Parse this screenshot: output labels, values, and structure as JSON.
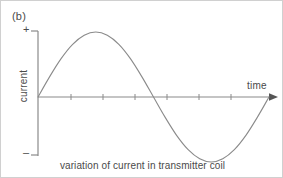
{
  "figure": {
    "panel_label": "(b)",
    "caption": "variation of current in transmitter coil",
    "background_color": "#ffffff",
    "line_color": "#808080",
    "text_color": "#4a4a4a"
  },
  "axes": {
    "y_title": "current",
    "y_positive_marker": "+",
    "y_negative_marker": "–",
    "x_title": "time",
    "x_arrow": "arrow-right"
  },
  "chart_data": {
    "type": "line",
    "title": "variation of current in transmitter coil",
    "xlabel": "time",
    "ylabel": "current",
    "grid": false,
    "legend": null,
    "xlim": [
      0,
      1.0
    ],
    "ylim": [
      -1.12,
      1.12
    ],
    "x_tick_labels": [],
    "y_tick_labels": [
      "+",
      "–"
    ],
    "x_tick_count": 6,
    "annotations": [
      "(b)"
    ],
    "series": [
      {
        "name": "transmitter coil current",
        "description": "one full sine cycle starting at zero, rising to a positive peak, falling through zero to a negative trough, then rising back through zero",
        "x": [
          0.0,
          0.05,
          0.1,
          0.15,
          0.2,
          0.25,
          0.3,
          0.35,
          0.4,
          0.45,
          0.5,
          0.55,
          0.6,
          0.65,
          0.7,
          0.75,
          0.8,
          0.85,
          0.9,
          0.95,
          1.0
        ],
        "y": [
          0.0,
          0.31,
          0.59,
          0.81,
          0.95,
          1.0,
          0.95,
          0.81,
          0.59,
          0.31,
          0.0,
          -0.31,
          -0.59,
          -0.81,
          -0.95,
          -1.0,
          -0.95,
          -0.81,
          -0.59,
          -0.31,
          0.0
        ]
      }
    ]
  }
}
